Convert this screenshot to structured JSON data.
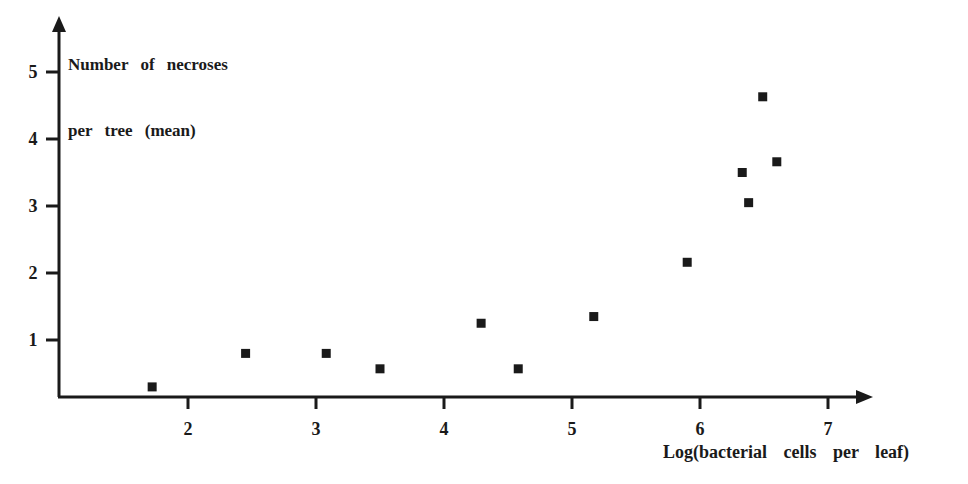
{
  "chart_data": {
    "type": "scatter",
    "title": "",
    "xlabel": "Log(bacterial cells per leaf)",
    "ylabel": "Number of necroses per tree (mean)",
    "ylabel_lines": [
      "Number of necroses",
      "per tree (mean)"
    ],
    "xlim": [
      1.0,
      7.3
    ],
    "ylim": [
      0,
      5.5
    ],
    "xticks": [
      2,
      3,
      4,
      5,
      6,
      7
    ],
    "yticks": [
      1,
      2,
      3,
      4,
      5
    ],
    "grid": false,
    "legend": null,
    "marker": "square",
    "marker_color": "#1a1a1a",
    "points": [
      {
        "x": 1.72,
        "y": 0.3
      },
      {
        "x": 2.45,
        "y": 0.8
      },
      {
        "x": 3.08,
        "y": 0.8
      },
      {
        "x": 3.5,
        "y": 0.57
      },
      {
        "x": 4.29,
        "y": 1.25
      },
      {
        "x": 4.58,
        "y": 0.57
      },
      {
        "x": 5.17,
        "y": 1.35
      },
      {
        "x": 5.9,
        "y": 2.16
      },
      {
        "x": 6.33,
        "y": 3.5
      },
      {
        "x": 6.38,
        "y": 3.05
      },
      {
        "x": 6.49,
        "y": 4.63
      },
      {
        "x": 6.6,
        "y": 3.66
      }
    ]
  }
}
